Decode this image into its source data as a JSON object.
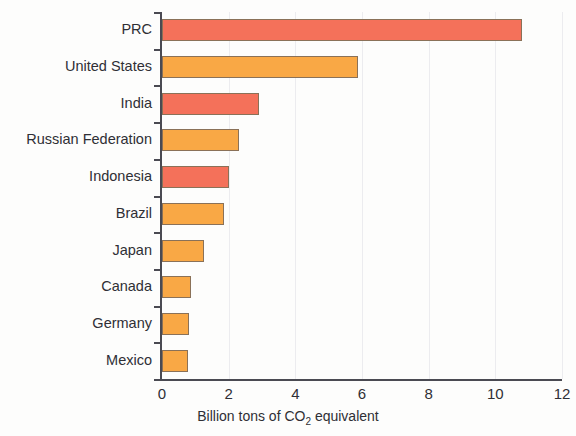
{
  "chart_data": {
    "type": "bar",
    "orientation": "horizontal",
    "title": "",
    "xlabel": "Billion tons of CO2 equivalent",
    "xlabel_prefix": "Billion tons of CO",
    "xlabel_subscript": "2",
    "xlabel_suffix": " equivalent",
    "ylabel": "",
    "xlim": [
      0,
      12
    ],
    "xticks": [
      0,
      2,
      4,
      6,
      8,
      10,
      12
    ],
    "xtick_labels": [
      "0",
      "2",
      "4",
      "6",
      "8",
      "10",
      "12"
    ],
    "grid": true,
    "grid_axis": "x",
    "legend": false,
    "categories": [
      "PRC",
      "United States",
      "India",
      "Russian Federation",
      "Indonesia",
      "Brazil",
      "Japan",
      "Canada",
      "Germany",
      "Mexico"
    ],
    "values": [
      10.8,
      5.88,
      2.9,
      2.3,
      2.0,
      1.85,
      1.25,
      0.88,
      0.82,
      0.78
    ],
    "bar_colors": [
      "#f4715a",
      "#f9a845",
      "#f4715a",
      "#f9a845",
      "#f4715a",
      "#f9a845",
      "#f9a845",
      "#f9a845",
      "#f9a845",
      "#f9a845"
    ]
  },
  "colors": {
    "coral": "#f4715a",
    "orange": "#f9a845",
    "axis": "#4a4a52",
    "grid": "#ececef",
    "text": "#2f2f35",
    "background": "#fdfdfc"
  }
}
